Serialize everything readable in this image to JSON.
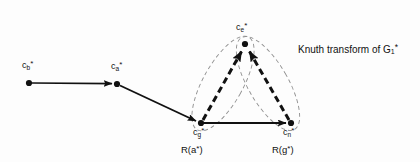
{
  "figure": {
    "background_color": "#fdfdfd",
    "ink_color": "#111111",
    "dash_color": "#8a8a8a",
    "caption": {
      "prefix": "Knuth transform of G",
      "subscript": "1",
      "star": "*",
      "full_text": "Knuth transform of G1*"
    },
    "nodes": [
      {
        "id": "cb",
        "name": "c",
        "subscript": "b",
        "star": "*",
        "x": 29,
        "y": 83,
        "label_x": 24,
        "label_y": 62,
        "label_text": "cb*"
      },
      {
        "id": "ca",
        "name": "c",
        "subscript": "a",
        "star": "*",
        "x": 117,
        "y": 84,
        "label_x": 113,
        "label_y": 63,
        "label_text": "ca*"
      },
      {
        "id": "ce",
        "name": "c",
        "subscript": "e",
        "star": "*",
        "x": 245,
        "y": 44,
        "label_x": 236,
        "label_y": 23,
        "label_text": "ce*"
      },
      {
        "id": "cg",
        "name": "c",
        "subscript": "g",
        "star": "*",
        "x": 201,
        "y": 123,
        "label_x": 194,
        "label_y": 127,
        "label_text": "cg*"
      },
      {
        "id": "cn",
        "name": "c",
        "subscript": "n",
        "star": "*",
        "x": 291,
        "y": 123,
        "label_x": 284,
        "label_y": 127,
        "label_text": "cn*"
      }
    ],
    "regions": [
      {
        "id": "Ra",
        "text_prefix": "R(a",
        "text_suffix": ")",
        "star": "*",
        "label_x": 180,
        "label_y": 145,
        "full_text": "R(a*)"
      },
      {
        "id": "Rg",
        "text_prefix": "R(g",
        "text_suffix": ")",
        "star": "*",
        "label_x": 271,
        "label_y": 145,
        "full_text": "R(g*)"
      }
    ],
    "edges": [
      {
        "from": "cb",
        "to": "ca",
        "style": "solid",
        "weight": "thin"
      },
      {
        "from": "ca",
        "to": "cg",
        "style": "solid",
        "weight": "thin"
      },
      {
        "from": "cg",
        "to": "cn",
        "style": "solid",
        "weight": "thin"
      },
      {
        "from": "cg",
        "to": "ce",
        "style": "dashed",
        "weight": "thick"
      },
      {
        "from": "cn",
        "to": "ce",
        "style": "dashed",
        "weight": "thick"
      }
    ],
    "enclosures": [
      {
        "id": "capsule-left",
        "description": "dashed capsule enclosing cg and ce",
        "rotation_deg": 29
      },
      {
        "id": "capsule-right",
        "description": "dashed capsule enclosing cn and ce",
        "rotation_deg": -30
      }
    ]
  }
}
